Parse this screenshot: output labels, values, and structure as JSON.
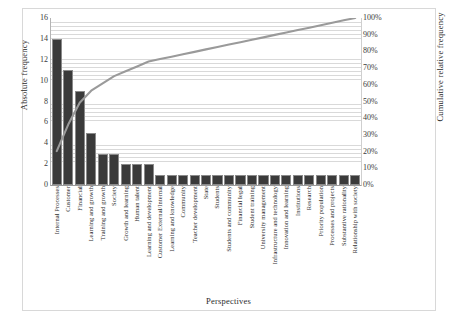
{
  "chart_data": {
    "type": "bar",
    "title": "",
    "subtitle": "",
    "xlabel": "Perspectives",
    "ylabel": "Absolute frequency",
    "y2label": "Cumulative relative frequency",
    "ylim": [
      0,
      16
    ],
    "y2lim": [
      0,
      100
    ],
    "grid": true,
    "legend": "none",
    "bar_color": "#3a3a3a",
    "line_color": "#9a9a9a",
    "categories": [
      "Internal Processes",
      "Customer",
      "Financial",
      "Learning and growth",
      "Training and growth",
      "Society",
      "Growth and learning",
      "Human talent",
      "Learning and development",
      "Customer External/Internal",
      "Learning and knowledge",
      "Community",
      "Teacher development",
      "State",
      "Students",
      "Students and community",
      "Financial legal",
      "Student training",
      "University management",
      "Infrastructure and technology",
      "Innovation and learning",
      "Institutions",
      "Research",
      "Priority population",
      "Processes and projects",
      "Substantive rationality",
      "Relationship with society"
    ],
    "values": [
      14,
      11,
      9,
      5,
      3,
      3,
      2,
      2,
      2,
      1,
      1,
      1,
      1,
      1,
      1,
      1,
      1,
      1,
      1,
      1,
      1,
      1,
      1,
      1,
      1,
      1,
      1
    ],
    "total": 69,
    "cumulative_percent": [
      20.3,
      36.2,
      49.3,
      56.5,
      60.9,
      65.2,
      68.1,
      71.0,
      73.9,
      75.4,
      76.8,
      78.3,
      79.7,
      81.2,
      82.6,
      84.1,
      85.5,
      87.0,
      88.4,
      89.9,
      91.3,
      92.8,
      94.2,
      95.7,
      97.1,
      98.6,
      100.0
    ],
    "yticks": [
      "0",
      "2",
      "4",
      "6",
      "8",
      "10",
      "12",
      "14",
      "16"
    ],
    "ytick_values": [
      0,
      2,
      4,
      6,
      8,
      10,
      12,
      14,
      16
    ],
    "y2ticks": [
      "0%",
      "10%",
      "20%",
      "30%",
      "40%",
      "50%",
      "60%",
      "70%",
      "80%",
      "90%",
      "100%"
    ],
    "y2tick_values": [
      0,
      10,
      20,
      30,
      40,
      50,
      60,
      70,
      80,
      90,
      100
    ]
  }
}
